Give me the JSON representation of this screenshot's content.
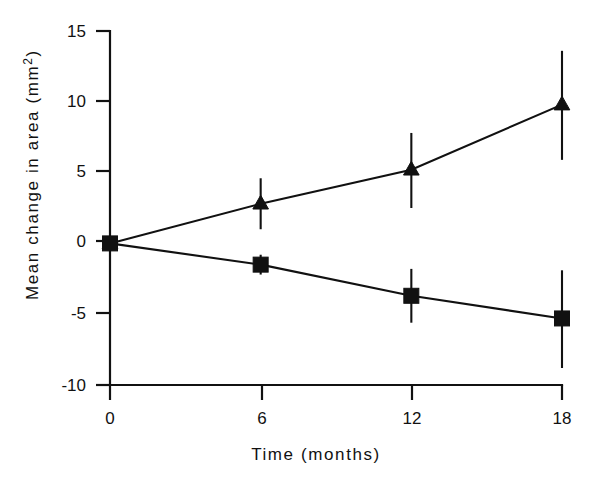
{
  "chart_data": {
    "type": "line",
    "title": "",
    "xlabel": "Time (months)",
    "ylabel": "Mean change in area (mm²)",
    "ylabel_base": "Mean change in area (mm",
    "ylabel_sup": "2",
    "ylabel_close": ")",
    "x": [
      0,
      6,
      12,
      18
    ],
    "xtick_labels": [
      "0",
      "6",
      "12",
      "18"
    ],
    "ytick_labels": [
      "15",
      "10",
      "5",
      "0",
      "-5",
      "-10"
    ],
    "ytick_values": [
      15,
      10,
      5,
      0,
      -5,
      -10
    ],
    "xlim": [
      0,
      18
    ],
    "ylim": [
      -10,
      15
    ],
    "grid": false,
    "legend": "none",
    "series": [
      {
        "name": "increase-series",
        "marker": "triangle-up",
        "color": "#111111",
        "values": [
          0.0,
          2.8,
          5.2,
          9.8
        ],
        "err_low": [
          0.0,
          1.0,
          2.5,
          5.9
        ],
        "err_high": [
          0.0,
          4.6,
          7.8,
          13.6
        ]
      },
      {
        "name": "decrease-series",
        "marker": "square",
        "color": "#111111",
        "values": [
          0.0,
          -1.5,
          -3.7,
          -5.3
        ],
        "err_low": [
          0.0,
          -2.2,
          -5.6,
          -8.8
        ],
        "err_high": [
          0.0,
          -0.8,
          -1.8,
          -1.9
        ]
      }
    ]
  },
  "figure": {
    "background_color": "#ffffff",
    "ink_color": "#111111"
  }
}
